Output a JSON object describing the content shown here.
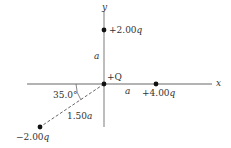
{
  "diagram": {
    "axes": {
      "x_label": "x",
      "y_label": "y",
      "color": "#9a9a9a"
    },
    "charges": [
      {
        "id": "center",
        "label": "+Q",
        "position": "origin"
      },
      {
        "id": "top",
        "label": "+2.00",
        "unit": "q",
        "position": "on +y axis"
      },
      {
        "id": "right",
        "label": "+4.00",
        "unit": "q",
        "position": "on +x axis"
      },
      {
        "id": "lower-left",
        "label": "−2.00",
        "unit": "q",
        "position": "below-left of origin"
      }
    ],
    "distances": {
      "top": "a",
      "right": "a",
      "lower_left_value": "1.50",
      "lower_left_unit": "a"
    },
    "angle": {
      "value": "35.0°"
    },
    "colors": {
      "axis": "#9a9a9a",
      "charge_dot": "#111111",
      "text": "#333333",
      "dashed_line": "#555555"
    }
  }
}
